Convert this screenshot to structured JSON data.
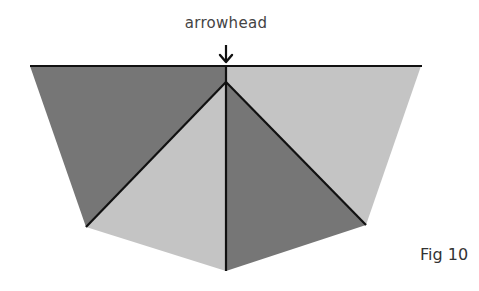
{
  "diagram": {
    "annotation": "arrowhead",
    "figure_label": "Fig 10",
    "colors": {
      "dark_gray": "#767676",
      "light_gray": "#c4c4c4",
      "line": "#111111",
      "background": "#ffffff"
    },
    "points": {
      "top_left": [
        30,
        66
      ],
      "top_right": [
        421,
        66
      ],
      "top_center": [
        226,
        66
      ],
      "apex": [
        226,
        82
      ],
      "left_bottom": [
        86,
        227
      ],
      "right_bottom": [
        366,
        225
      ],
      "bottom": [
        226,
        271
      ]
    },
    "regions": [
      {
        "name": "left-outer",
        "shade": "dark"
      },
      {
        "name": "left-inner",
        "shade": "light"
      },
      {
        "name": "right-inner",
        "shade": "dark"
      },
      {
        "name": "right-outer",
        "shade": "light"
      }
    ]
  }
}
